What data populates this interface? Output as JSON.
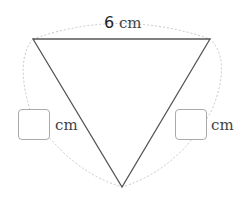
{
  "diagram": {
    "shape": "equilateral-triangle",
    "top_side": {
      "value": "6",
      "unit": "cm"
    },
    "left_side": {
      "value": "",
      "unit": "cm"
    },
    "right_side": {
      "value": "",
      "unit": "cm"
    }
  },
  "colors": {
    "stroke": "#555555",
    "dotted": "#c8c8c8",
    "box_border": "#aaaaaa"
  }
}
